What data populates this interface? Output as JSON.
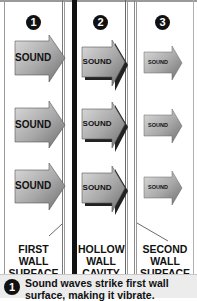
{
  "diagram": {
    "steps": [
      {
        "number": "1",
        "arrow_label": "SOUND",
        "wall_label": [
          "FIRST",
          "WALL",
          "SURFACE"
        ]
      },
      {
        "number": "2",
        "arrow_label": "SOUND",
        "wall_label": [
          "HOLLOW",
          "WALL",
          "CAVITY"
        ]
      },
      {
        "number": "3",
        "arrow_label": "SOUND",
        "wall_label": [
          "SECOND",
          "WALL",
          "SURFACE"
        ]
      }
    ],
    "caption": {
      "number": "1",
      "line1": "Sound waves strike first wall",
      "line2": "surface, making it vibrate."
    },
    "colors": {
      "background": "#ffffff",
      "arrow_fill_light": "#d4d4d4",
      "arrow_fill_dark": "#7a7a7a",
      "wall_black": "#111111",
      "wall_gray": "#8a8a8a",
      "caption_bg": "#ececec"
    }
  }
}
